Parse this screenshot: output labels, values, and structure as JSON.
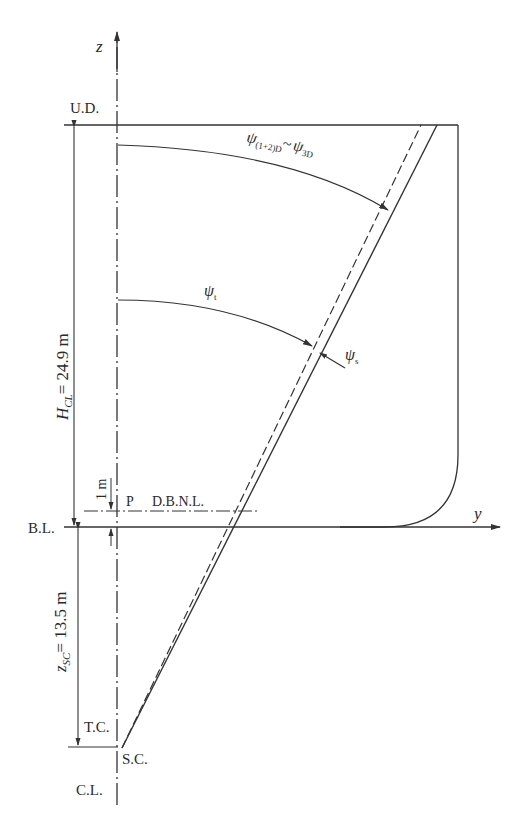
{
  "diagram": {
    "type": "ship-section-rotation-schematic",
    "axes": {
      "z_label": "z",
      "y_label": "y"
    },
    "levels": {
      "upper_deck": "U.D.",
      "base_line": "B.L.",
      "tower_center": "T.C.",
      "shear_center": "S.C.",
      "center_line": "C.L.",
      "point_p": "P",
      "double_bottom_neutral_line": "D.B.N.L."
    },
    "dimensions": {
      "h_cl": {
        "symbol": "H",
        "subscript": "CL",
        "value": "= 24.9 m"
      },
      "z_sc": {
        "symbol": "z",
        "subscript": "SC",
        "value": "= 13.5 m"
      },
      "offset": "1 m"
    },
    "angles": {
      "psi_upper": {
        "symbol": "ψ",
        "subscript": "(1+2)D",
        "tilde": "~",
        "symbol2": "ψ",
        "subscript2": "3D"
      },
      "psi_t": {
        "symbol": "ψ",
        "subscript": "t"
      },
      "psi_s": {
        "symbol": "ψ",
        "subscript": "s"
      }
    },
    "colors": {
      "ink": "#333333",
      "background": "#ffffff"
    }
  }
}
